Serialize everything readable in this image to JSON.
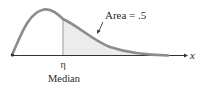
{
  "diagram": {
    "type": "right-skewed-density",
    "area_label": "Area = .5",
    "median_symbol": "η",
    "median_label": "Median",
    "axis_label": "x",
    "colors": {
      "curve": "#8c8c8c",
      "shade": "#ececec",
      "axis": "#333333",
      "median_line": "#9a9a9a",
      "text": "#2a2a2a"
    }
  }
}
